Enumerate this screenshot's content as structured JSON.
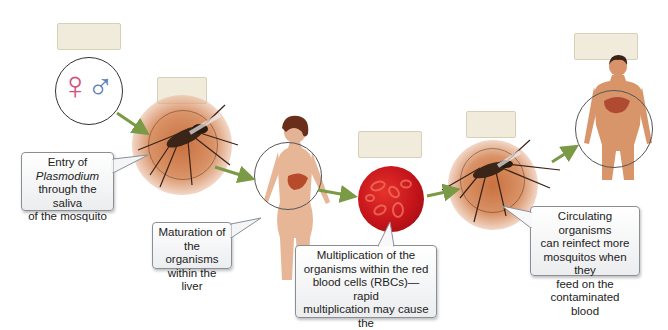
{
  "diagram": {
    "stages": [
      {
        "id": "sexual-reproduction",
        "icon": "female-male-symbols",
        "label_box": ""
      },
      {
        "id": "mosquito-bite",
        "icon": "mosquito",
        "label_box": ""
      },
      {
        "id": "liver",
        "icon": "female-human-liver",
        "label_box": ""
      },
      {
        "id": "red-blood-cells",
        "icon": "red-blood-cells",
        "label_box": ""
      },
      {
        "id": "mosquito-reinfect",
        "icon": "mosquito",
        "label_box": ""
      },
      {
        "id": "male-human",
        "icon": "male-human-liver",
        "label_box": ""
      }
    ],
    "callouts": {
      "entry": {
        "line1": "Entry of",
        "line2": "Plasmodium",
        "line3": "through the saliva",
        "line4": "of the mosquito"
      },
      "liver": {
        "line1": "Maturation of",
        "line2": "the organisms",
        "line3": "within the liver"
      },
      "rbc": {
        "line1": "Multiplication of the",
        "line2": "organisms within the red",
        "line3": "blood cells (RBCs)—rapid",
        "line4": "multiplication may cause the",
        "line5": "RBCs to rupture (hemolysis)"
      },
      "reinfect": {
        "line1": "Circulating organisms",
        "line2": "can reinfect more",
        "line3": "mosquitos when they",
        "line4": "feed on the",
        "line5": "contaminated blood"
      }
    },
    "symbols": {
      "female": "♀",
      "male": "♂"
    },
    "colors": {
      "arrow": "#7a9a45",
      "label_box": "#f1ebdc",
      "female_symbol": "#d2507a",
      "male_symbol": "#5b7fb8",
      "rbc": "#c4141a"
    }
  }
}
